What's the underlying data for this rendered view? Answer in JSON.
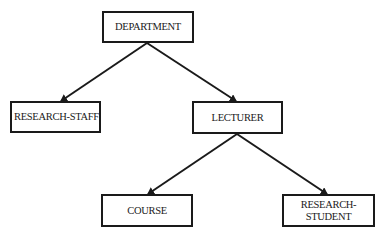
{
  "diagram": {
    "type": "hierarchy",
    "nodes": [
      {
        "id": "department",
        "label": "DEPARTMENT"
      },
      {
        "id": "research_staff",
        "label": "RESEARCH-STAFF"
      },
      {
        "id": "lecturer",
        "label": "LECTURER"
      },
      {
        "id": "course",
        "label": "COURSE"
      },
      {
        "id": "research_student",
        "label": "RESEARCH-\nSTUDENT"
      }
    ],
    "edges": [
      {
        "from": "department",
        "to": "research_staff"
      },
      {
        "from": "department",
        "to": "lecturer"
      },
      {
        "from": "lecturer",
        "to": "course"
      },
      {
        "from": "lecturer",
        "to": "research_student"
      }
    ]
  },
  "colors": {
    "line": "#1a1a1a",
    "background": "#ffffff"
  }
}
